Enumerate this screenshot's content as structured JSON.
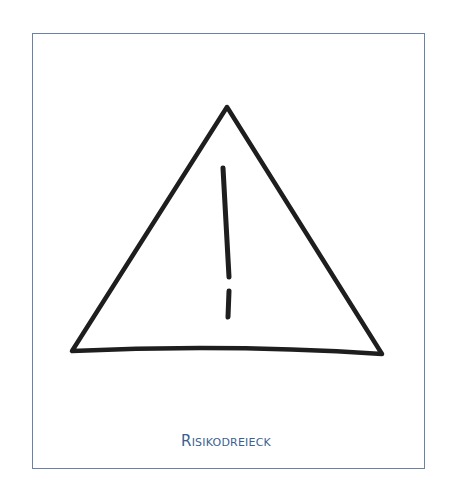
{
  "figure": {
    "caption": "Risikodreieck",
    "frame_color": "#6a82a8",
    "caption_color": "#3d5f8f",
    "stroke_color": "#1e1e1e",
    "icon": "warning-triangle-exclamation"
  }
}
